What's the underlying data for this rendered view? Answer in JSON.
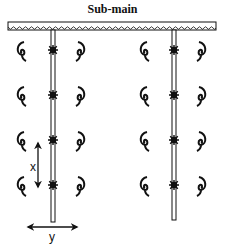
{
  "diagram": {
    "title": "Sub-main",
    "labels": {
      "x_spacing": "x",
      "y_spacing": "y"
    },
    "submain": {
      "x1": 8,
      "x2": 216,
      "y": 22,
      "height": 8
    },
    "laterals": [
      {
        "name": "lateral-left",
        "x": 53,
        "y_start": 30,
        "y_end": 222
      },
      {
        "name": "lateral-right",
        "x": 174,
        "y_start": 30,
        "y_end": 220
      }
    ],
    "emitter_rows_y": [
      50,
      95,
      140,
      185
    ],
    "plant_offsets_x": [
      -31,
      27
    ],
    "colors": {
      "line": "#111111",
      "background": "#ffffff"
    }
  }
}
